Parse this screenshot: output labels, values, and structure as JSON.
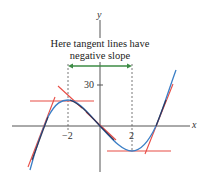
{
  "figure": {
    "annotation_line1": "Here tangent lines have",
    "annotation_line2": "negative slope",
    "axis_x_label": "x",
    "axis_y_label": "y",
    "tick_neg2": "−2",
    "tick_2": "2",
    "tick_30": "30"
  },
  "colors": {
    "curve": "#3b7fc6",
    "tangent": "#e84c45",
    "arrow": "#3d8b45",
    "axis": "#444444"
  }
}
